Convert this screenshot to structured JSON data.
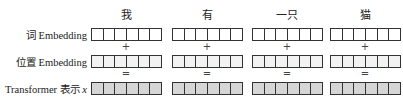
{
  "tokens": [
    "我",
    "有",
    "一只",
    "猫"
  ],
  "rows": {
    "word": {
      "label": "词 Embedding"
    },
    "position": {
      "label": "位置 Embedding"
    },
    "output": {
      "label_prefix": "Transformer 表示 ",
      "label_var": "x"
    }
  },
  "operators": {
    "plus": "+",
    "equals": "="
  },
  "cells_per_vector": 6,
  "colors": {
    "word_fill": "#ffffff",
    "position_fill": "#f2f2f2",
    "output_fill": "#d6d6d6",
    "border": "#333333"
  }
}
